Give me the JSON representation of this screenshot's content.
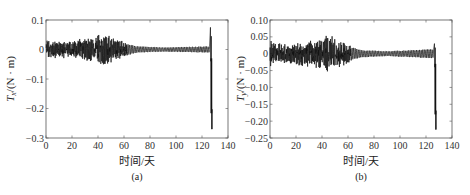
{
  "chart_data": [
    {
      "id": "a",
      "type": "line",
      "caption": "(a)",
      "xlabel": "时间/天",
      "ylabel_main": "T",
      "ylabel_sub": "x",
      "ylabel_unit": "/(N · m)",
      "xlim": [
        0,
        140
      ],
      "ylim": [
        -0.3,
        0.1
      ],
      "xticks": [
        0,
        20,
        40,
        60,
        80,
        100,
        120,
        140
      ],
      "yticks": [
        0.1,
        0,
        -0.1,
        -0.2,
        -0.3
      ],
      "ytick_labels": [
        "0.1",
        "0",
        "−0.1",
        "−0.2",
        "−0.3"
      ],
      "grid": false,
      "series": [
        {
          "name": "Tx",
          "description": "Oscillating torque: dense noisy band ±0.02–0.05 from day 0 to ~60, decaying to ~±0.01 regular oscillation until ~126, then spike up to ~0.07 and drop to ~-0.27 at ~127-128",
          "envelope": [
            {
              "x": 0,
              "amp": 0.03
            },
            {
              "x": 10,
              "amp": 0.025
            },
            {
              "x": 20,
              "amp": 0.03
            },
            {
              "x": 30,
              "amp": 0.035
            },
            {
              "x": 40,
              "amp": 0.045
            },
            {
              "x": 45,
              "amp": 0.05
            },
            {
              "x": 55,
              "amp": 0.035
            },
            {
              "x": 60,
              "amp": 0.025
            },
            {
              "x": 70,
              "amp": 0.012
            },
            {
              "x": 90,
              "amp": 0.008
            },
            {
              "x": 110,
              "amp": 0.01
            },
            {
              "x": 125,
              "amp": 0.012
            }
          ],
          "spike": {
            "x": 126.5,
            "max": 0.075,
            "min": -0.27
          }
        }
      ]
    },
    {
      "id": "b",
      "type": "line",
      "caption": "(b)",
      "xlabel": "时间/天",
      "ylabel_main": "T",
      "ylabel_sub": "y",
      "ylabel_unit": "/(N · m)",
      "xlim": [
        0,
        140
      ],
      "ylim": [
        -0.25,
        0.1
      ],
      "xticks": [
        0,
        20,
        40,
        60,
        80,
        100,
        120,
        140
      ],
      "yticks": [
        0.1,
        0.05,
        0,
        -0.05,
        -0.1,
        -0.15,
        -0.2,
        -0.25
      ],
      "ytick_labels": [
        "0.10",
        "0.05",
        "0",
        "−0.05",
        "−0.10",
        "−0.15",
        "−0.20",
        "−0.25"
      ],
      "grid": false,
      "series": [
        {
          "name": "Ty",
          "description": "Oscillating torque: dense band ±0.02–0.05 from day 0 to ~60, decaying to ~±0.01 regular oscillation until ~126, then spike up to ~0.03 and drop to ~-0.22 at ~127-128",
          "envelope": [
            {
              "x": 0,
              "amp": 0.035
            },
            {
              "x": 10,
              "amp": 0.025
            },
            {
              "x": 20,
              "amp": 0.03
            },
            {
              "x": 30,
              "amp": 0.035
            },
            {
              "x": 40,
              "amp": 0.045
            },
            {
              "x": 45,
              "amp": 0.05
            },
            {
              "x": 55,
              "amp": 0.035
            },
            {
              "x": 60,
              "amp": 0.025
            },
            {
              "x": 70,
              "amp": 0.012
            },
            {
              "x": 90,
              "amp": 0.008
            },
            {
              "x": 110,
              "amp": 0.012
            },
            {
              "x": 125,
              "amp": 0.015
            }
          ],
          "spike": {
            "x": 126.5,
            "max": 0.03,
            "min": -0.225
          }
        }
      ]
    }
  ],
  "layout": {
    "panels": [
      {
        "left": 46,
        "right": 228,
        "top": 20,
        "bottom": 138
      },
      {
        "left": 270,
        "right": 452,
        "top": 20,
        "bottom": 138
      }
    ],
    "line_color": "#111111",
    "axis_color": "#555555"
  }
}
